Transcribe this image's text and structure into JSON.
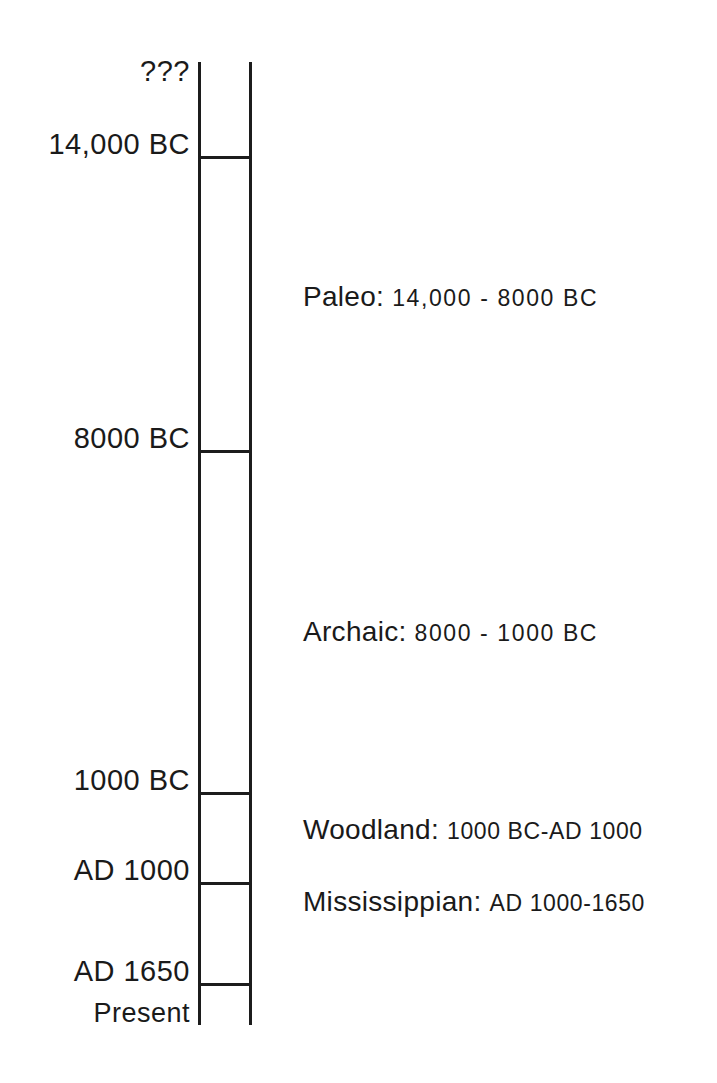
{
  "diagram": {
    "type": "vertical-timeline",
    "line_color": "#1c1c1c",
    "background_color": "#ffffff"
  },
  "axis": {
    "top_marker": "???",
    "bottom_marker": "Present",
    "ticks": [
      {
        "label": "14,000 BC",
        "y": 156
      },
      {
        "label": "8000 BC",
        "y": 450
      },
      {
        "label": "1000 BC",
        "y": 792
      },
      {
        "label": "AD 1000",
        "y": 882
      },
      {
        "label": "AD 1650",
        "y": 983
      }
    ]
  },
  "periods": [
    {
      "name": "Paleo:",
      "range": "14,000  -  8000 BC",
      "start": "14,000 BC",
      "end": "8000 BC",
      "label_y": 295
    },
    {
      "name": "Archaic:",
      "range": "8000  -  1000 BC",
      "start": "8000 BC",
      "end": "1000 BC",
      "label_y": 630
    },
    {
      "name": "Woodland:",
      "range": "1000 BC-AD 1000",
      "start": "1000 BC",
      "end": "AD 1000",
      "label_y": 828
    },
    {
      "name": "Mississippian:",
      "range": "AD 1000-1650",
      "start": "AD 1000",
      "end": "AD 1650",
      "label_y": 900
    }
  ]
}
